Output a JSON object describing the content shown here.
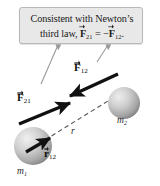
{
  "figure": {
    "name": "newtons-third-law-gravitation-diagram",
    "background_color": "#ffffff"
  },
  "callout": {
    "line1": "Consistent with Newton’s",
    "line2_prefix": "third law,",
    "equation": {
      "left_symbol": "F",
      "left_subscript": "21",
      "relation": "=",
      "sign": "−",
      "right_symbol": "F",
      "right_subscript": "12",
      "terminator": "."
    },
    "background_color": "#e8e8e8",
    "border_color": "#b8b8b8",
    "text_color": "#1a1a1a"
  },
  "leaders": [
    {
      "name": "leader-to-f21",
      "color": "#9a9a9a"
    },
    {
      "name": "leader-to-f12",
      "color": "#9a9a9a"
    }
  ],
  "vectors": [
    {
      "name": "force-f12",
      "symbol": "F",
      "subscript": "12",
      "label": "F12",
      "color": "#111111",
      "direction": "down-left",
      "description": "force on body 1 from body 2"
    },
    {
      "name": "force-f21",
      "symbol": "F",
      "subscript": "21",
      "label": "F21",
      "color": "#111111",
      "direction": "up-right",
      "description": "force on body 2 from body 1"
    },
    {
      "name": "displacement-r12",
      "symbol": "r",
      "subscript": "12",
      "label": "r12",
      "color": "#111111",
      "direction": "up-right",
      "description": "unit displacement from body 1 toward body 2"
    }
  ],
  "separation": {
    "name": "separation-distance",
    "label": "r",
    "line_style": "dashed",
    "color": "#555555"
  },
  "masses": [
    {
      "name": "mass-m1",
      "label": "m",
      "subscript": "1",
      "cx": 33,
      "cy": 146,
      "r": 19,
      "fill_light": "#e2e2e2",
      "fill_dark": "#8e8e8e"
    },
    {
      "name": "mass-m2",
      "label": "m",
      "subscript": "2",
      "cx": 124,
      "cy": 103,
      "r": 16,
      "fill_light": "#dedede",
      "fill_dark": "#8a8a8a"
    }
  ]
}
